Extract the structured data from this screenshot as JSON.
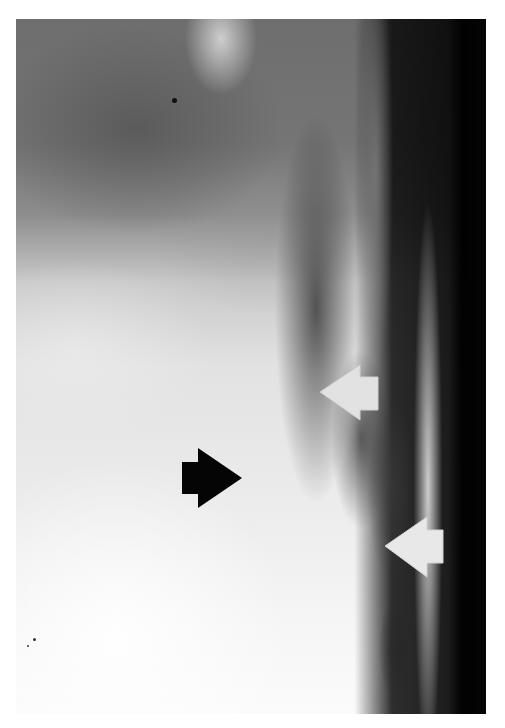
{
  "figure": {
    "type": "radiograph",
    "arrows": [
      {
        "id": "white-arrow-upper",
        "color": "#e4e4e4",
        "direction": "left",
        "tip": [
          320,
          392
        ]
      },
      {
        "id": "black-arrow",
        "color": "#050505",
        "direction": "right",
        "tip": [
          242,
          478
        ]
      },
      {
        "id": "white-arrow-lower",
        "color": "#e8e8e8",
        "direction": "left",
        "tip": [
          385,
          546
        ]
      }
    ]
  }
}
